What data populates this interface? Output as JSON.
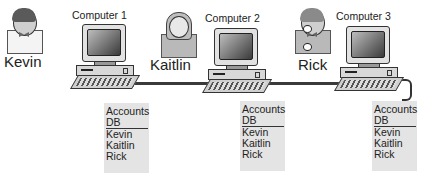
{
  "diagram": {
    "title": "",
    "network": {
      "type": "bus",
      "connections": [
        "Computer 1",
        "Computer 2",
        "Computer 3"
      ]
    },
    "nodes": [
      {
        "computer_label": "Computer 1",
        "user": "Kevin",
        "db": {
          "title_line1": "Accounts",
          "title_line2": "DB",
          "entries": [
            "Kevin",
            "Kaitlin",
            "Rick"
          ]
        }
      },
      {
        "computer_label": "Computer 2",
        "user": "Kaitlin",
        "db": {
          "title_line1": "Accounts",
          "title_line2": "DB",
          "entries": [
            "Kevin",
            "Kaitlin",
            "Rick"
          ]
        }
      },
      {
        "computer_label": "Computer 3",
        "user": "Rick",
        "db": {
          "title_line1": "Accounts",
          "title_line2": "DB",
          "entries": [
            "Kevin",
            "Kaitlin",
            "Rick"
          ]
        }
      }
    ],
    "colors": {
      "db_background": "#e4e4e4",
      "bus_line": "#3a3a3a",
      "text": "#222222"
    }
  }
}
